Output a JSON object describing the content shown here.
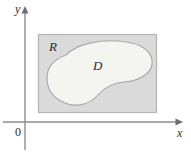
{
  "figure": {
    "type": "math-region-diagram",
    "background_color": "#ffffff",
    "labels": {
      "region_outer": "R",
      "region_inner": "D",
      "x_axis": "x",
      "y_axis": "y",
      "origin": "0"
    },
    "axes": {
      "x_axis_y_position": 122,
      "y_axis_x_position": 25,
      "axis_color": "#8d8d93",
      "arrow_color": "#6e6e74",
      "x_arrow_end_x": 182,
      "y_arrow_end_y": 8
    },
    "outer_region": {
      "name": "R",
      "shape": "rectangle",
      "fill_color": "#dadada",
      "stroke_color": "#b4b4b4",
      "left": 38,
      "top": 34,
      "width": 119,
      "height": 79
    },
    "inner_region": {
      "name": "D",
      "shape": "bean-blob",
      "fill_color": "#f4f4f1",
      "stroke_color": "#a8a8ad"
    }
  }
}
